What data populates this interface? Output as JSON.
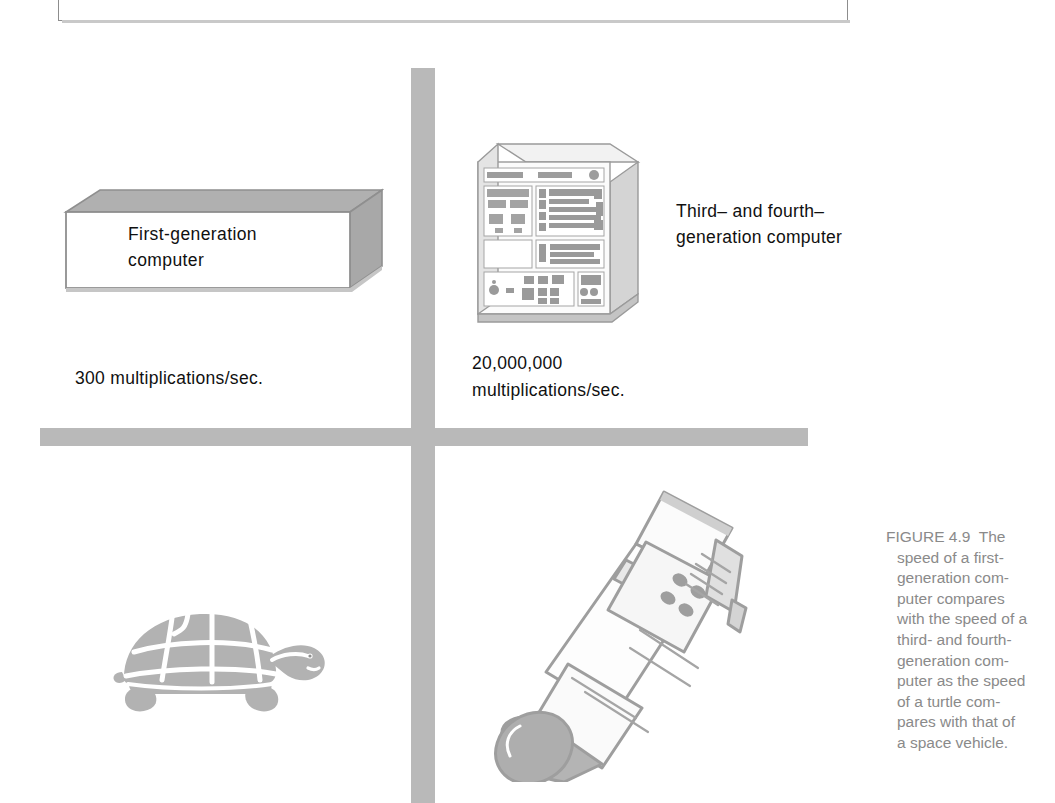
{
  "page": {
    "width": 1055,
    "height": 803,
    "background": "#ffffff",
    "ink_gray": "#b9b9b9",
    "caption_gray": "#8a8a8a",
    "text_black": "#101010"
  },
  "diagram": {
    "quadrants": {
      "top_left": "first-generation computer",
      "top_right": "third- and fourth-generation computer",
      "bottom_left": "turtle",
      "bottom_right": "space vehicle"
    },
    "first_generation": {
      "box_label_line1": "First-generation",
      "box_label_line2": "computer",
      "speed": "300 multiplications/sec."
    },
    "modern_generation": {
      "label_line1": "Third– and fourth–",
      "label_line2": "generation computer",
      "speed_line1": "20,000,000",
      "speed_line2": "multiplications/sec."
    },
    "animals": {
      "slow": "turtle",
      "fast": "space vehicle"
    }
  },
  "caption": {
    "figure_number": "FIGURE 4.9",
    "lines": [
      "FIGURE 4.9  The",
      "speed of a first-",
      "generation com-",
      "puter compares",
      "with the speed of a",
      "third- and fourth-",
      "generation com-",
      "puter as the speed",
      "of a turtle com-",
      "pares with that of",
      "a space vehicle."
    ],
    "full_text": "FIGURE 4.9  The speed of a first-generation computer compares with the speed of a third- and fourth-generation computer as the speed of a turtle compares with that of a space vehicle."
  }
}
